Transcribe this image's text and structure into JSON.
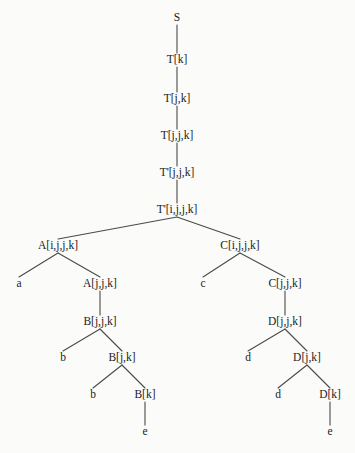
{
  "figure": {
    "background_color": "#fbfbf9",
    "line_color": "#4a4a4a",
    "text_color": "#1b1b1b"
  },
  "tree": {
    "nodes": [
      {
        "id": "n0",
        "label": "S",
        "x": 177,
        "y": 18,
        "kind": "root"
      },
      {
        "id": "n1",
        "label": "T[k]",
        "x": 177,
        "y": 60,
        "kind": "internal"
      },
      {
        "id": "n2",
        "label": "T[j,k]",
        "x": 177,
        "y": 99,
        "kind": "internal"
      },
      {
        "id": "n3",
        "label": "T[j,j,k]",
        "x": 177,
        "y": 136,
        "kind": "internal"
      },
      {
        "id": "n4",
        "label": "T'[j,j,k]",
        "x": 177,
        "y": 173,
        "kind": "internal"
      },
      {
        "id": "n5",
        "label": "T'[i,j,j,k]",
        "x": 177,
        "y": 210,
        "kind": "internal"
      },
      {
        "id": "n6",
        "label": "A[i,j,j,k]",
        "x": 58,
        "y": 246,
        "kind": "internal"
      },
      {
        "id": "n7",
        "label": "a",
        "x": 19,
        "y": 284,
        "kind": "leaf"
      },
      {
        "id": "n8",
        "label": "A[j,j,k]",
        "x": 100,
        "y": 284,
        "kind": "internal"
      },
      {
        "id": "n9",
        "label": "B[j,j,k]",
        "x": 100,
        "y": 322,
        "kind": "internal"
      },
      {
        "id": "n10",
        "label": "b",
        "x": 63,
        "y": 358,
        "kind": "leaf"
      },
      {
        "id": "n11",
        "label": "B[j,k]",
        "x": 122,
        "y": 358,
        "kind": "internal"
      },
      {
        "id": "n12",
        "label": "b",
        "x": 93,
        "y": 395,
        "kind": "leaf"
      },
      {
        "id": "n13",
        "label": "B[k]",
        "x": 145,
        "y": 395,
        "kind": "internal"
      },
      {
        "id": "n14",
        "label": "e",
        "x": 145,
        "y": 432,
        "kind": "leaf"
      },
      {
        "id": "n15",
        "label": "C[i,j,j,k]",
        "x": 240,
        "y": 246,
        "kind": "internal"
      },
      {
        "id": "n16",
        "label": "c",
        "x": 203,
        "y": 284,
        "kind": "leaf"
      },
      {
        "id": "n17",
        "label": "C[j,j,k]",
        "x": 285,
        "y": 284,
        "kind": "internal"
      },
      {
        "id": "n18",
        "label": "D[j,j,k]",
        "x": 285,
        "y": 322,
        "kind": "internal"
      },
      {
        "id": "n19",
        "label": "d",
        "x": 248,
        "y": 358,
        "kind": "leaf"
      },
      {
        "id": "n20",
        "label": "D[j,k]",
        "x": 307,
        "y": 358,
        "kind": "internal"
      },
      {
        "id": "n21",
        "label": "d",
        "x": 278,
        "y": 395,
        "kind": "leaf"
      },
      {
        "id": "n22",
        "label": "D[k]",
        "x": 330,
        "y": 395,
        "kind": "internal"
      },
      {
        "id": "n23",
        "label": "e",
        "x": 330,
        "y": 432,
        "kind": "leaf"
      }
    ],
    "edges": [
      {
        "from": "n0",
        "to": "n1"
      },
      {
        "from": "n1",
        "to": "n2"
      },
      {
        "from": "n2",
        "to": "n3"
      },
      {
        "from": "n3",
        "to": "n4"
      },
      {
        "from": "n4",
        "to": "n5"
      },
      {
        "from": "n5",
        "to": "n6"
      },
      {
        "from": "n5",
        "to": "n15"
      },
      {
        "from": "n6",
        "to": "n7"
      },
      {
        "from": "n6",
        "to": "n8"
      },
      {
        "from": "n8",
        "to": "n9"
      },
      {
        "from": "n9",
        "to": "n10"
      },
      {
        "from": "n9",
        "to": "n11"
      },
      {
        "from": "n11",
        "to": "n12"
      },
      {
        "from": "n11",
        "to": "n13"
      },
      {
        "from": "n13",
        "to": "n14"
      },
      {
        "from": "n15",
        "to": "n16"
      },
      {
        "from": "n15",
        "to": "n17"
      },
      {
        "from": "n17",
        "to": "n18"
      },
      {
        "from": "n18",
        "to": "n19"
      },
      {
        "from": "n18",
        "to": "n20"
      },
      {
        "from": "n20",
        "to": "n21"
      },
      {
        "from": "n20",
        "to": "n22"
      },
      {
        "from": "n22",
        "to": "n23"
      }
    ]
  }
}
